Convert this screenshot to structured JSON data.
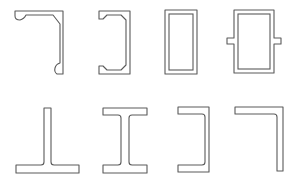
{
  "diagram": {
    "description": "Cross-section profiles of structural members",
    "rows": [
      {
        "name": "top-row",
        "profiles": [
          {
            "id": "lipped-angle-with-bulbs",
            "label": "Bulb-lipped angle section"
          },
          {
            "id": "lipped-channel",
            "label": "Lipped channel section"
          },
          {
            "id": "rectangular-hollow-section",
            "label": "Rectangular hollow section"
          },
          {
            "id": "box-section-with-side-tabs",
            "label": "Box section with side flanges"
          }
        ]
      },
      {
        "name": "bottom-row",
        "profiles": [
          {
            "id": "tee-section",
            "label": "T section"
          },
          {
            "id": "i-beam-section",
            "label": "I section"
          },
          {
            "id": "channel-section",
            "label": "Channel section"
          },
          {
            "id": "angle-section",
            "label": "Angle section"
          }
        ]
      }
    ],
    "colors": {
      "background": "#ffffff",
      "outline": "#5a5a5a"
    }
  }
}
